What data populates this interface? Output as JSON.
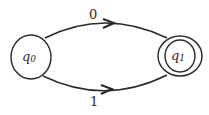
{
  "diagram": {
    "type": "finite-automaton",
    "states": [
      {
        "id": "q0",
        "label": "q",
        "subscript": "0",
        "accepting": false
      },
      {
        "id": "q1",
        "label": "q",
        "subscript": "1",
        "accepting": true
      }
    ],
    "transitions": [
      {
        "from": "q0",
        "to": "q1",
        "label": "0"
      },
      {
        "from": "q0",
        "to": "q1",
        "label": "1"
      }
    ],
    "colors": {
      "stroke": "#2a2a2a",
      "background": "#ffffff"
    }
  }
}
